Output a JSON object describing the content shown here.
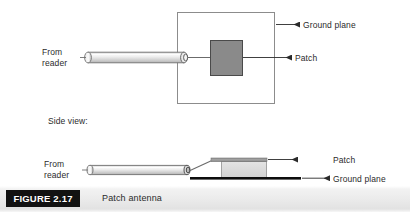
{
  "figure": {
    "number_label": "FIGURE 2.17",
    "caption": "Patch antenna"
  },
  "colors": {
    "ground_plane_outline": "#8c8c8c",
    "patch_fill_top": "#8a8a8a",
    "patch_outline_top": "#4a4a4a",
    "cable_body_light": "#f2f2f2",
    "cable_body_mid": "#d9d9d9",
    "cable_outline": "#6f6f6f",
    "leader_line": "#3a3a3a",
    "substrate_fill": "#dcdcdc",
    "patch_bar_fill": "#9a9a9a",
    "ground_plane_bar": "#0d0d0d",
    "caption_box_bg": "#121212",
    "caption_box_text": "#ffffff",
    "label_text": "#2b2b2b"
  },
  "top_view": {
    "from_reader_label": "From\nreader",
    "ground_plane_label": "Ground plane",
    "patch_label": "Patch"
  },
  "side_view": {
    "section_label": "Side view:",
    "from_reader_label": "From\nreader",
    "patch_label": "Patch",
    "ground_plane_label": "Ground plane"
  }
}
